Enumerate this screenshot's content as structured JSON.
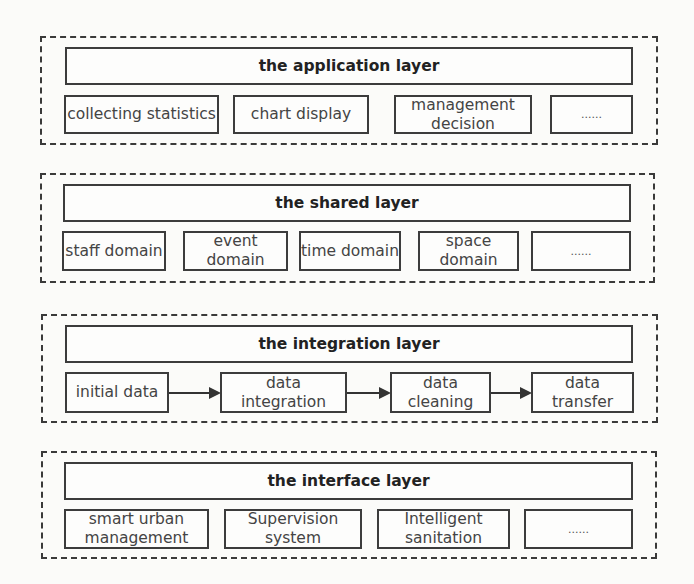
{
  "layers": {
    "application": {
      "title": "the application layer",
      "items": [
        "collecting statistics",
        "chart display",
        "management decision",
        "......"
      ]
    },
    "shared": {
      "title": "the shared layer",
      "items": [
        "staff domain",
        "event domain",
        "time domain",
        "space domain",
        "......"
      ]
    },
    "integration": {
      "title": "the integration layer",
      "items": [
        "initial data",
        "data integration",
        "data cleaning",
        "data transfer"
      ]
    },
    "interface": {
      "title": "the interface layer",
      "items": [
        "smart urban management",
        "Supervision system",
        "Intelligent sanitation",
        "......"
      ]
    }
  }
}
